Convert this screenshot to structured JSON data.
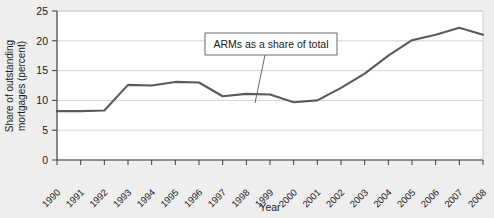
{
  "chart_data": {
    "type": "line",
    "title": "",
    "xlabel": "Year",
    "ylabel": "Share of outstanding mortgages (percent)",
    "ylabel_line1": "Share of outstanding",
    "ylabel_line2": "mortgages (percent)",
    "categories": [
      "1990",
      "1991",
      "1992",
      "1993",
      "1994",
      "1995",
      "1996",
      "1997",
      "1998",
      "1999",
      "2000",
      "2001",
      "2002",
      "2003",
      "2004",
      "2005",
      "2006",
      "2007",
      "2008"
    ],
    "x": [
      1990,
      1991,
      1992,
      1993,
      1994,
      1995,
      1996,
      1997,
      1998,
      1999,
      2000,
      2001,
      2002,
      2003,
      2004,
      2005,
      2006,
      2007,
      2008
    ],
    "values": [
      8.2,
      8.2,
      8.3,
      12.6,
      12.5,
      13.1,
      13.0,
      10.7,
      11.1,
      11.0,
      9.7,
      10.0,
      12.1,
      14.5,
      17.5,
      20.1,
      21.0,
      22.2,
      21.0
    ],
    "series": [
      {
        "name": "ARMs as a share of total",
        "values": [
          8.2,
          8.2,
          8.3,
          12.6,
          12.5,
          13.1,
          13.0,
          10.7,
          11.1,
          11.0,
          9.7,
          10.0,
          12.1,
          14.5,
          17.5,
          20.1,
          21.0,
          22.2,
          21.0
        ],
        "color": "#5a5a5a"
      }
    ],
    "ylim": [
      0,
      25
    ],
    "yticks": [
      0,
      5,
      10,
      15,
      20,
      25
    ],
    "ytick_labels": [
      "0",
      "5",
      "10",
      "15",
      "20",
      "25"
    ],
    "xlim": [
      1990,
      2008
    ],
    "grid": true,
    "grid_axis": "y",
    "legend": false,
    "annotations": [
      {
        "text": "ARMs as a share of total",
        "points_to_year": 2000,
        "points_to_value": 9.7
      }
    ]
  },
  "colors": {
    "page_background": "#eeeeee",
    "plot_background": "#ffffff",
    "line": "#5a5a5a",
    "grid": "#c9c9c9",
    "axis": "#3d3d3d",
    "text": "#1a1a1a",
    "annotation_border": "#55555f"
  }
}
